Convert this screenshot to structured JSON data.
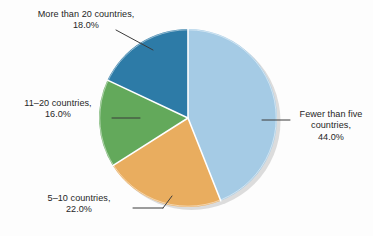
{
  "figure": {
    "background_color": "#fdfdfd",
    "text_color": "#262626",
    "leader_line_color": "#3b3b3b",
    "slice_separator_color": "#ffffff",
    "shadow_color": "#d4d4d4"
  },
  "chart_data": {
    "type": "pie",
    "title": "",
    "subtitle": "",
    "xlabel": "",
    "ylabel": "",
    "legend": "none",
    "grid": false,
    "start_angle_deg": 0,
    "direction": "clockwise",
    "categories": [
      "Fewer than five countries",
      "5–10 countries",
      "11–20 countries",
      "More than 20 countries"
    ],
    "values": [
      44.0,
      22.0,
      16.0,
      18.0
    ],
    "value_unit": "%",
    "colors": [
      "#a5cbe5",
      "#e9ad5f",
      "#63a95b",
      "#2d7ba7"
    ],
    "slices": [
      {
        "category": "Fewer than five countries",
        "value": 44.0,
        "label_line_1": "Fewer than five",
        "label_line_2": "countries,",
        "label_line_3": "44.0%",
        "label_text": "Fewer than five countries, 44.0%",
        "color": "#a5cbe5",
        "label_position": "right"
      },
      {
        "category": "5–10 countries",
        "value": 22.0,
        "label_line_1": "5–10 countries,",
        "label_line_2": "22.0%",
        "label_text": "5–10 countries, 22.0%",
        "color": "#e9ad5f",
        "label_position": "bottom-left"
      },
      {
        "category": "11–20 countries",
        "value": 16.0,
        "label_line_1": "11–20 countries,",
        "label_line_2": "16.0%",
        "label_text": "11–20 countries, 16.0%",
        "color": "#63a95b",
        "label_position": "left"
      },
      {
        "category": "More than 20 countries",
        "value": 18.0,
        "label_line_1": "More than 20 countries,",
        "label_line_2": "18.0%",
        "label_text": "More than 20 countries, 18.0%",
        "color": "#2d7ba7",
        "label_position": "top-left"
      }
    ]
  },
  "labels": {
    "more_than_20": "More than 20 countries,\n18.0%",
    "eleven_to_20": "11–20 countries,\n16.0%",
    "five_to_10": "5–10 countries,\n22.0%",
    "fewer_than_five": "Fewer than five\ncountries,\n44.0%"
  }
}
